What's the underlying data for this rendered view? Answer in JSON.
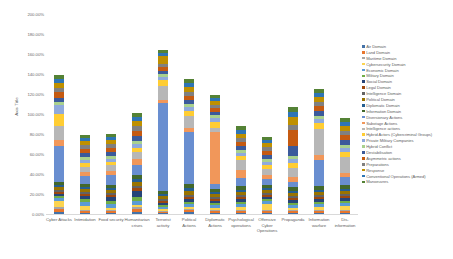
{
  "chart_data": {
    "type": "bar",
    "stacked": true,
    "title": "",
    "xlabel": "",
    "ylabel": "Axis Title",
    "ylim": [
      0,
      200
    ],
    "ytick_labels": [
      "0.00%",
      "20.00%",
      "40.00%",
      "60.00%",
      "80.00%",
      "100.00%",
      "120.00%",
      "140.00%",
      "160.00%",
      "180.00%",
      "200.00%"
    ],
    "ytick_values": [
      0,
      20,
      40,
      60,
      80,
      100,
      120,
      140,
      160,
      180,
      200
    ],
    "grid": false,
    "legend_position": "right",
    "categories": [
      "Cyber Attacks",
      "Intimidation",
      "Food security",
      "Humanitarian crises",
      "Terrorist activity",
      "Political Actions",
      "Diplomatic Actions",
      "Psychological operations",
      "Offensive Cyber Operations",
      "Propaganda",
      "Information warfare",
      "Dis-information"
    ],
    "series": [
      {
        "name": "Air Domain",
        "color": "#4472a8",
        "values": [
          2,
          1,
          1,
          2,
          1,
          2,
          1,
          1,
          1,
          1,
          1,
          1
        ]
      },
      {
        "name": "Land Domain",
        "color": "#e8762c",
        "values": [
          3,
          2,
          2,
          3,
          1,
          2,
          2,
          2,
          2,
          2,
          2,
          2
        ]
      },
      {
        "name": "Maritime Domain",
        "color": "#a6a6a6",
        "values": [
          2,
          1,
          1,
          2,
          1,
          1,
          1,
          1,
          1,
          1,
          1,
          1
        ]
      },
      {
        "name": "Cybersecurity Domain",
        "color": "#fcd450",
        "values": [
          6,
          4,
          2,
          2,
          2,
          2,
          2,
          3,
          6,
          2,
          3,
          4
        ]
      },
      {
        "name": "Economic Domain",
        "color": "#5b9bd5",
        "values": [
          3,
          4,
          4,
          4,
          2,
          3,
          3,
          3,
          3,
          3,
          3,
          3
        ]
      },
      {
        "name": "Military Domain",
        "color": "#70ad47",
        "values": [
          2,
          3,
          3,
          4,
          2,
          2,
          2,
          2,
          2,
          2,
          2,
          2
        ]
      },
      {
        "name": "Social Domain",
        "color": "#264478",
        "values": [
          2,
          3,
          4,
          6,
          2,
          3,
          2,
          3,
          2,
          3,
          3,
          3
        ]
      },
      {
        "name": "Legal Domain",
        "color": "#9e480e",
        "values": [
          2,
          2,
          2,
          3,
          2,
          2,
          2,
          2,
          2,
          2,
          2,
          2
        ]
      },
      {
        "name": "Intelligence Domain",
        "color": "#636363",
        "values": [
          2,
          2,
          2,
          2,
          2,
          2,
          2,
          2,
          2,
          2,
          2,
          2
        ]
      },
      {
        "name": "Political Domain",
        "color": "#997300",
        "values": [
          3,
          3,
          3,
          4,
          3,
          4,
          3,
          3,
          3,
          3,
          3,
          3
        ]
      },
      {
        "name": "Diplomatic Domain",
        "color": "#255e91",
        "values": [
          2,
          2,
          2,
          3,
          2,
          3,
          2,
          2,
          2,
          2,
          2,
          2
        ]
      },
      {
        "name": "Information Domain",
        "color": "#43682b",
        "values": [
          3,
          3,
          3,
          4,
          3,
          4,
          3,
          4,
          3,
          4,
          4,
          4
        ]
      },
      {
        "name": "Diversionary Actions",
        "color": "#698ed0",
        "values": [
          36,
          8,
          10,
          10,
          88,
          52,
          5,
          8,
          6,
          5,
          26,
          8
        ]
      },
      {
        "name": "Sabotage Actions",
        "color": "#f1975a",
        "values": [
          6,
          4,
          4,
          6,
          3,
          4,
          52,
          8,
          4,
          5,
          5,
          4
        ]
      },
      {
        "name": "Intelligence actions",
        "color": "#b7b7b7",
        "values": [
          14,
          5,
          6,
          7,
          14,
          12,
          4,
          10,
          6,
          9,
          26,
          16
        ]
      },
      {
        "name": "Hybrid Actors (Cybercriminal Groups)",
        "color": "#ffcd33",
        "values": [
          12,
          4,
          3,
          4,
          6,
          5,
          6,
          4,
          4,
          5,
          6,
          5
        ]
      },
      {
        "name": "Private Military Companies",
        "color": "#8faadc",
        "values": [
          9,
          3,
          3,
          4,
          3,
          4,
          4,
          3,
          3,
          4,
          4,
          4
        ]
      },
      {
        "name": "Hybrid Conflict",
        "color": "#a9d18e",
        "values": [
          3,
          3,
          3,
          3,
          3,
          3,
          3,
          3,
          3,
          3,
          3,
          3
        ]
      },
      {
        "name": "Destabilisation",
        "color": "#3b5a9b",
        "values": [
          4,
          4,
          4,
          5,
          3,
          4,
          3,
          4,
          4,
          10,
          5,
          5
        ]
      },
      {
        "name": "Asymmetric actions",
        "color": "#c55a11",
        "values": [
          6,
          4,
          4,
          5,
          4,
          4,
          4,
          4,
          4,
          16,
          5,
          5
        ]
      },
      {
        "name": "Preparations",
        "color": "#808080",
        "values": [
          4,
          4,
          4,
          5,
          3,
          4,
          3,
          4,
          4,
          5,
          4,
          4
        ]
      },
      {
        "name": "Response",
        "color": "#bf9000",
        "values": [
          5,
          4,
          4,
          5,
          8,
          5,
          4,
          4,
          4,
          8,
          5,
          5
        ]
      },
      {
        "name": "Conventional Operations (Armed)",
        "color": "#2e75b6",
        "values": [
          4,
          3,
          3,
          4,
          3,
          4,
          3,
          4,
          3,
          5,
          4,
          4
        ]
      },
      {
        "name": "Manoeuvres",
        "color": "#548235",
        "values": [
          4,
          3,
          3,
          4,
          3,
          4,
          3,
          4,
          3,
          5,
          4,
          4
        ]
      }
    ],
    "totals": [
      139,
      79,
      76,
      101,
      164,
      135,
      119,
      88,
      77,
      102,
      125,
      94
    ]
  }
}
